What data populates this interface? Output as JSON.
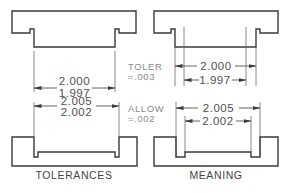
{
  "colors": {
    "line": "#3a3a3a",
    "extension": "#6a6a6a",
    "text": "#505050",
    "note": "#8a8a8a",
    "background": "#ffffff"
  },
  "left_panel": {
    "caption": "TOLERANCES",
    "tab_dimension": {
      "upper": "2.000",
      "lower": "1.997"
    },
    "slot_dimension": {
      "upper": "2.005",
      "lower": "2.002"
    }
  },
  "center_notes": {
    "tolerance": {
      "label": "TOLER",
      "value": "=.003"
    },
    "allowance": {
      "label": "ALLOW",
      "value": "=.002"
    }
  },
  "right_panel": {
    "caption": "MEANING",
    "tab_max": "2.000",
    "tab_min": "1.997",
    "slot_max": "2.005",
    "slot_min": "2.002"
  }
}
